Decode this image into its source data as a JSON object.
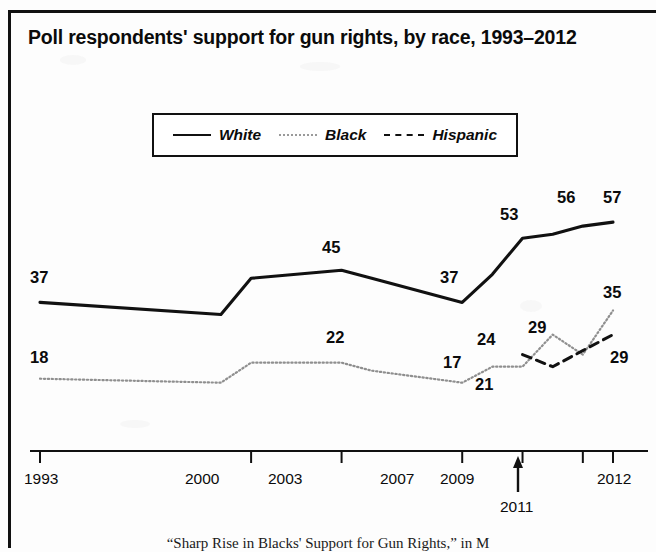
{
  "figure": {
    "title": "Poll respondents' support for gun rights, by race, 1993–2012",
    "caption": "“Sharp Rise in Blacks' Support for Gun Rights,” in M"
  },
  "legend": {
    "position": "top-center",
    "entries": [
      {
        "label": "White",
        "style": "solid",
        "color": "#111111"
      },
      {
        "label": "Black",
        "style": "dotted",
        "color": "#9a9a9a"
      },
      {
        "label": "Hispanic",
        "style": "dashed",
        "color": "#111111"
      }
    ]
  },
  "axis": {
    "ticks": [
      "1993",
      "2000",
      "2003",
      "2007",
      "2009",
      "2011",
      "2012"
    ],
    "annotated_tick": "2011",
    "annotation_icon": "up-arrow-icon"
  },
  "chart_data": {
    "type": "line",
    "title": "Poll respondents' support for gun rights, by race, 1993–2012",
    "xlabel": "",
    "ylabel": "",
    "ylim": [
      0,
      65
    ],
    "grid": false,
    "legend_position": "top-center",
    "x": [
      1993,
      1999,
      2000,
      2003,
      2004,
      2007,
      2008,
      2009,
      2010,
      2011,
      2012
    ],
    "series": [
      {
        "name": "White",
        "style": "solid",
        "color": "#111111",
        "values": [
          37,
          34,
          43,
          45,
          43,
          37,
          44,
          53,
          54,
          56,
          57
        ],
        "labels": [
          {
            "x": 1993,
            "value": 37
          },
          {
            "x": 2003,
            "value": 45
          },
          {
            "x": 2007,
            "value": 37
          },
          {
            "x": 2009,
            "value": 53
          },
          {
            "x": 2011,
            "value": 56
          },
          {
            "x": 2012,
            "value": 57
          }
        ]
      },
      {
        "name": "Black",
        "style": "dotted",
        "color": "#9a9a9a",
        "values": [
          18,
          17,
          22,
          22,
          20,
          17,
          21,
          21,
          29,
          24,
          35
        ],
        "labels": [
          {
            "x": 1993,
            "value": 18
          },
          {
            "x": 2003,
            "value": 22
          },
          {
            "x": 2007,
            "value": 17
          },
          {
            "x": 2009,
            "value": 21
          },
          {
            "x": 2010,
            "value": 29
          },
          {
            "x": 2012,
            "value": 35
          }
        ]
      },
      {
        "name": "Hispanic",
        "style": "dashed",
        "color": "#111111",
        "values": [
          null,
          null,
          null,
          null,
          null,
          null,
          null,
          24,
          21,
          25,
          29
        ],
        "labels": [
          {
            "x": 2009,
            "value": 24
          },
          {
            "x": 2012,
            "value": 29
          }
        ]
      }
    ]
  },
  "value_labels": [
    {
      "text": "37",
      "left": 30,
      "top": 268
    },
    {
      "text": "45",
      "left": 322,
      "top": 238
    },
    {
      "text": "37",
      "left": 440,
      "top": 268
    },
    {
      "text": "53",
      "left": 500,
      "top": 205
    },
    {
      "text": "56",
      "left": 557,
      "top": 188
    },
    {
      "text": "57",
      "left": 603,
      "top": 188
    },
    {
      "text": "18",
      "left": 30,
      "top": 348
    },
    {
      "text": "22",
      "left": 326,
      "top": 328
    },
    {
      "text": "17",
      "left": 443,
      "top": 353
    },
    {
      "text": "21",
      "left": 475,
      "top": 375
    },
    {
      "text": "24",
      "left": 477,
      "top": 330
    },
    {
      "text": "29",
      "left": 528,
      "top": 318
    },
    {
      "text": "35",
      "left": 603,
      "top": 283
    },
    {
      "text": "29",
      "left": 610,
      "top": 348
    }
  ],
  "x_tick_labels": [
    {
      "text": "1993",
      "left": 24,
      "top": 470
    },
    {
      "text": "2000",
      "left": 185,
      "top": 470
    },
    {
      "text": "2003",
      "left": 268,
      "top": 470
    },
    {
      "text": "2007",
      "left": 380,
      "top": 470
    },
    {
      "text": "2009",
      "left": 440,
      "top": 470
    },
    {
      "text": "2012",
      "left": 597,
      "top": 470
    },
    {
      "text": "2011",
      "left": 500,
      "top": 498
    }
  ]
}
